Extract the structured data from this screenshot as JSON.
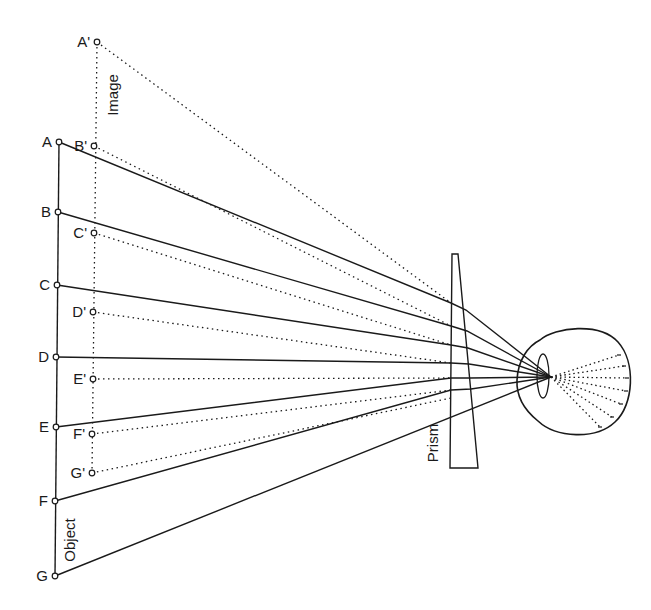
{
  "diagram": {
    "type": "optics-ray-diagram",
    "colors": {
      "stroke": "#1a1a1a",
      "background": "#ffffff"
    },
    "labels": {
      "object": "Object",
      "image": "Image",
      "prism": "Prism"
    },
    "object_points": [
      {
        "label": "A",
        "x": 59,
        "y": 142
      },
      {
        "label": "B",
        "x": 58,
        "y": 212
      },
      {
        "label": "C",
        "x": 57,
        "y": 285
      },
      {
        "label": "D",
        "x": 56,
        "y": 357
      },
      {
        "label": "E",
        "x": 56,
        "y": 427
      },
      {
        "label": "F",
        "x": 55,
        "y": 501
      },
      {
        "label": "G",
        "x": 55,
        "y": 576
      }
    ],
    "image_points": [
      {
        "label": "A'",
        "x": 97,
        "y": 42
      },
      {
        "label": "B'",
        "x": 94,
        "y": 146
      },
      {
        "label": "C'",
        "x": 94,
        "y": 233
      },
      {
        "label": "D'",
        "x": 93,
        "y": 312
      },
      {
        "label": "E'",
        "x": 93,
        "y": 379
      },
      {
        "label": "F'",
        "x": 92,
        "y": 434
      },
      {
        "label": "G'",
        "x": 92,
        "y": 473
      }
    ],
    "prism_hits": [
      {
        "left": [
          451,
          303
        ],
        "right": [
          466,
          310
        ]
      },
      {
        "left": [
          451,
          326
        ],
        "right": [
          467,
          331
        ]
      },
      {
        "left": [
          451,
          345
        ],
        "right": [
          468,
          348
        ]
      },
      {
        "left": [
          451,
          363
        ],
        "right": [
          469,
          364
        ]
      },
      {
        "left": [
          451,
          378
        ],
        "right": [
          470,
          378
        ]
      },
      {
        "left": [
          451,
          390
        ],
        "right": [
          471,
          389
        ]
      },
      {
        "left": [
          451,
          398
        ],
        "right": [
          471,
          396
        ]
      }
    ],
    "focal_point": {
      "x": 551,
      "y": 377
    },
    "retina_ends": [
      [
        619,
        355
      ],
      [
        624,
        366
      ],
      [
        627,
        378
      ],
      [
        626,
        391
      ],
      [
        621,
        404
      ],
      [
        612,
        417
      ],
      [
        600,
        427
      ]
    ]
  }
}
